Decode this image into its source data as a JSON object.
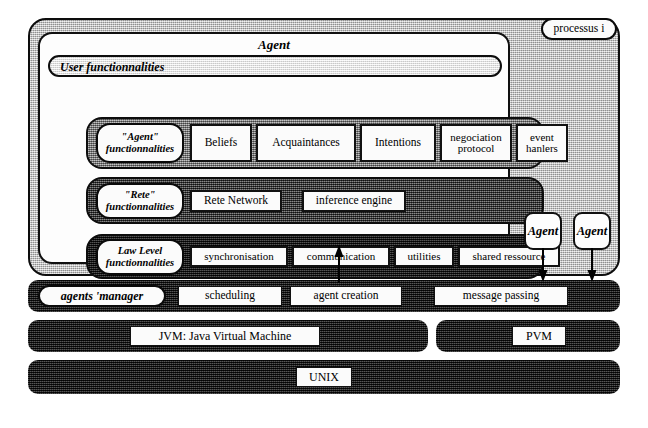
{
  "diagram": {
    "process_tag": "processus i"
  },
  "agent": {
    "title": "Agent",
    "user_functionalities": "User functionnalities",
    "layers": [
      {
        "id": "agent-layer",
        "label": "\"Agent\"\nfonctionnalites",
        "label_line1": "\"Agent\"",
        "label_line2": "functionnalities",
        "shade": "#8e8e8e",
        "items": [
          {
            "text": "Beliefs"
          },
          {
            "text": "Acquaintances"
          },
          {
            "text": "Intentions"
          },
          {
            "text": "negociation protocol"
          },
          {
            "text": "event hanlers"
          }
        ]
      },
      {
        "id": "rete-layer",
        "label_line1": "\"Rete\"",
        "label_line2": "functionnalities",
        "shade": "#4a4a4a",
        "items": [
          {
            "text": "Rete Network"
          },
          {
            "text": "inference engine"
          }
        ]
      },
      {
        "id": "low-level-layer",
        "label_line1": "Law Level",
        "label_line2": "functionnalities",
        "shade": "#1d1d1d",
        "items": [
          {
            "text": "synchronisation"
          },
          {
            "text": "communication"
          },
          {
            "text": "utilities"
          },
          {
            "text": "shared ressource"
          }
        ]
      }
    ]
  },
  "side_agents": [
    {
      "label": "Agent"
    },
    {
      "label": "Agent"
    }
  ],
  "manager": {
    "label": "agents 'manager",
    "items": [
      {
        "text": "scheduling"
      },
      {
        "text": "agent creation"
      },
      {
        "text": "message passing"
      }
    ]
  },
  "vm_layer": [
    {
      "text": "JVM: Java Virtual Machine"
    },
    {
      "text": "PVM"
    }
  ],
  "os_layer": {
    "text": "UNIX"
  },
  "colors": {
    "ink": "#000000",
    "paper": "#ffffff",
    "shade_light": "#c9c9c9",
    "shade_mid": "#8e8e8e",
    "shade_dark": "#4a4a4a",
    "shade_black": "#1d1d1d"
  }
}
